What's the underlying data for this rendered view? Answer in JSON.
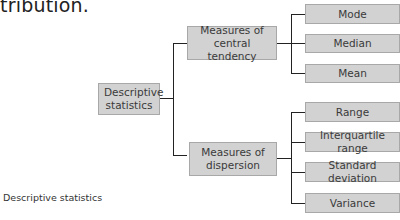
{
  "intro_text": "tribution.",
  "diagram": {
    "root": {
      "label": "Descriptive statistics"
    },
    "branches": [
      {
        "label": "Measures of central tendency",
        "leaves": [
          "Mode",
          "Median",
          "Mean"
        ]
      },
      {
        "label": "Measures of dispersion",
        "leaves": [
          "Range",
          "Interquartile range",
          "Standard deviation",
          "Variance"
        ]
      }
    ],
    "colors": {
      "box_fill": "#d2d2d2",
      "box_border": "#a8a8a8",
      "connector": "#222222"
    }
  },
  "caption": "Descriptive statistics"
}
